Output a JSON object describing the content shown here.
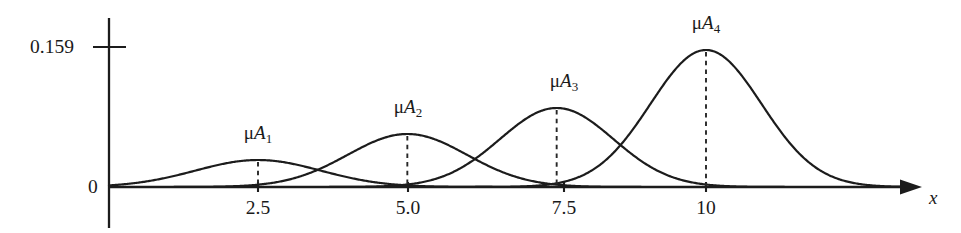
{
  "figure": {
    "type": "membership-function-plot",
    "background_color": "#ffffff",
    "ink_color": "#1c1c1c"
  },
  "axes": {
    "y_axis": {
      "name": "y-axis",
      "x_px": 109,
      "top_px": 18,
      "bottom_px": 228,
      "baseline_px": 187,
      "zero_label": "0",
      "max_tick_label": "0.159",
      "max_tick_y_px": 47
    },
    "x_axis": {
      "name": "x-axis",
      "y_px": 187,
      "start_px": 109,
      "end_px": 920,
      "label": "x",
      "tick_labels": [
        "2.5",
        "5.0",
        "7.5",
        "10"
      ],
      "tick_x_px": [
        258,
        408,
        564,
        706
      ]
    }
  },
  "chart_data": {
    "type": "line",
    "title": "",
    "subtitle": "",
    "xlabel": "x",
    "ylabel": "",
    "grid": false,
    "legend_position": "inline-annotations",
    "xlim": [
      0,
      13.5
    ],
    "ylim": [
      0,
      0.1749
    ],
    "y_tick_values": [
      0,
      0.159
    ],
    "y_tick_labels": [
      "0",
      "0.159"
    ],
    "x_tick_values": [
      2.5,
      5.0,
      7.5,
      10
    ],
    "x_tick_labels": [
      "2.5",
      "5.0",
      "7.5",
      "10"
    ],
    "series": [
      {
        "name": "mu_A1",
        "label_mu": "μ",
        "label_base": "A",
        "label_index": "1",
        "center": 2.5,
        "peak_value": 0.0313,
        "peak_px_height": 27,
        "sigma": 1.05,
        "center_px": 258,
        "label_x_px": 258,
        "label_y_px": 123,
        "peak_y_px": 160
      },
      {
        "name": "mu_A2",
        "label_mu": "μ",
        "label_base": "A",
        "label_index": "2",
        "center": 5.0,
        "peak_value": 0.0615,
        "peak_px_height": 53,
        "sigma": 1.0,
        "center_px": 408,
        "label_x_px": 408,
        "label_y_px": 97,
        "peak_y_px": 134
      },
      {
        "name": "mu_A3",
        "label_mu": "μ",
        "label_base": "A",
        "label_index": "3",
        "center": 7.5,
        "peak_value": 0.0917,
        "peak_px_height": 79,
        "sigma": 0.95,
        "center_px": 564,
        "label_x_px": 564,
        "label_y_px": 71,
        "peak_y_px": 108
      },
      {
        "name": "mu_A4",
        "label_mu": "μ",
        "label_base": "A",
        "label_index": "4",
        "center": 10.0,
        "peak_value": 0.159,
        "peak_px_height": 137,
        "sigma": 0.93,
        "center_px": 706,
        "label_x_px": 706,
        "label_y_px": 13,
        "peak_y_px": 50
      }
    ]
  }
}
